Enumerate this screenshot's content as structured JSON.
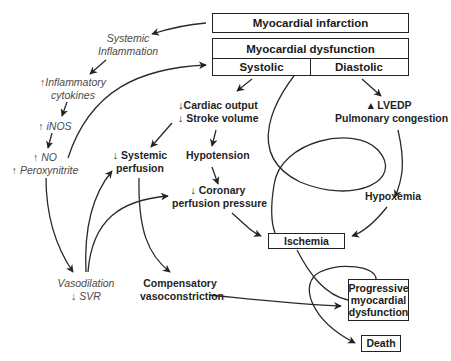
{
  "diagram": {
    "type": "flowchart",
    "nodes": {
      "mi": "Myocardial infarction",
      "dysfunction": "Myocardial dysfunction",
      "systolic": "Systolic",
      "diastolic": "Diastolic",
      "systemic_inflammation": [
        "Systemic",
        "Inflammation"
      ],
      "inflammatory_cytokines": [
        "↑Inflammatory",
        "cytokines"
      ],
      "inos": "↑ iNOS",
      "no": "↑ NO",
      "peroxynitrite": "↑ Peroxynitrite",
      "cardiac_output": [
        "↓Cardiac output",
        "↓ Stroke volume"
      ],
      "lvedp": [
        "▴ LVEDP",
        "Pulmonary congestion"
      ],
      "systemic_perfusion": [
        "↓ Systemic",
        "perfusion"
      ],
      "hypotension": "Hypotension",
      "coronary_perfusion": [
        "↓ Coronary",
        "perfusion pressure"
      ],
      "hypoxemia": "Hypoxemia",
      "ischemia": "Ischemia",
      "vasodilation": [
        "Vasodilation",
        "↓ SVR"
      ],
      "compensatory": [
        "Compensatory",
        "vasoconstriction"
      ],
      "progressive": [
        "Progressive",
        "myocardial",
        "dysfunction"
      ],
      "death": "Death"
    },
    "edges": [
      [
        "Myocardial infarction",
        "Systemic Inflammation"
      ],
      [
        "Systemic Inflammation",
        "Inflammatory cytokines"
      ],
      [
        "Inflammatory cytokines",
        "iNOS"
      ],
      [
        "iNOS",
        "NO / Peroxynitrite"
      ],
      [
        "NO / Peroxynitrite",
        "Myocardial dysfunction"
      ],
      [
        "NO / Peroxynitrite",
        "Vasodilation / SVR"
      ],
      [
        "Systolic",
        "Cardiac output / Stroke volume"
      ],
      [
        "Diastolic",
        "LVEDP / Pulmonary congestion"
      ],
      [
        "Cardiac output / Stroke volume",
        "Systemic perfusion"
      ],
      [
        "Cardiac output / Stroke volume",
        "Hypotension"
      ],
      [
        "Hypotension",
        "Coronary perfusion pressure"
      ],
      [
        "LVEDP / Pulmonary congestion",
        "Hypoxemia"
      ],
      [
        "Coronary perfusion pressure",
        "Ischemia"
      ],
      [
        "Hypoxemia",
        "Ischemia"
      ],
      [
        "Vasodilation / SVR",
        "Systemic perfusion"
      ],
      [
        "Vasodilation / SVR",
        "Coronary perfusion pressure"
      ],
      [
        "Systemic perfusion",
        "Compensatory vasoconstriction"
      ],
      [
        "Compensatory vasoconstriction",
        "Progressive myocardial dysfunction"
      ],
      [
        "Ischemia",
        "Progressive myocardial dysfunction"
      ],
      [
        "Progressive myocardial dysfunction",
        "Myocardial dysfunction (loop)"
      ],
      [
        "Progressive myocardial dysfunction",
        "Death"
      ]
    ]
  }
}
